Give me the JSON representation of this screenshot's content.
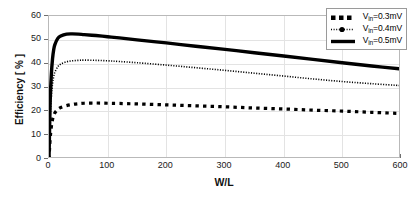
{
  "chart_data": {
    "type": "line",
    "title": "",
    "xlabel": "W/L",
    "ylabel": "Efficiency [ % ]",
    "xlim": [
      0,
      600
    ],
    "ylim": [
      0,
      60
    ],
    "xticks": [
      0,
      100,
      200,
      300,
      400,
      500,
      600
    ],
    "yticks": [
      0,
      10,
      20,
      30,
      40,
      50,
      60
    ],
    "grid": true,
    "legend_position": "upper-right",
    "series": [
      {
        "name": "V_in=0.3mV",
        "label_main": "V",
        "label_sub": "in",
        "label_tail": "=0.3mV",
        "style": "dashed",
        "color": "#000000",
        "linewidth": 3.2,
        "x": [
          0,
          2,
          4,
          6,
          8,
          10,
          15,
          20,
          30,
          40,
          50,
          60,
          80,
          100,
          120,
          150,
          200,
          250,
          300,
          350,
          400,
          450,
          500,
          550,
          600
        ],
        "y": [
          0,
          8.5,
          13.5,
          16.5,
          18.2,
          19.4,
          20.8,
          21.6,
          22.4,
          22.9,
          23.2,
          23.4,
          23.5,
          23.4,
          23.3,
          23.1,
          22.7,
          22.3,
          21.9,
          21.4,
          21.0,
          20.5,
          20.1,
          19.6,
          19.1
        ]
      },
      {
        "name": "V_in=0.4mV",
        "label_main": "V",
        "label_sub": "in",
        "label_tail": "=0.4mV",
        "style": "dotted",
        "color": "#000000",
        "linewidth": 1.6,
        "x": [
          0,
          2,
          4,
          6,
          8,
          10,
          15,
          20,
          30,
          40,
          50,
          60,
          80,
          100,
          120,
          150,
          200,
          250,
          300,
          350,
          400,
          450,
          500,
          550,
          600
        ],
        "y": [
          0,
          17.0,
          26.0,
          31.5,
          34.6,
          36.4,
          38.7,
          39.8,
          40.8,
          41.2,
          41.4,
          41.5,
          41.4,
          41.2,
          40.9,
          40.4,
          39.4,
          38.3,
          37.2,
          36.0,
          34.8,
          33.6,
          32.5,
          31.6,
          30.8
        ]
      },
      {
        "name": "V_in=0.5mV",
        "label_main": "V",
        "label_sub": "in",
        "label_tail": "=0.5mV",
        "style": "solid",
        "color": "#000000",
        "linewidth": 3.4,
        "x": [
          0,
          2,
          4,
          6,
          8,
          10,
          15,
          20,
          30,
          40,
          50,
          60,
          80,
          100,
          120,
          150,
          200,
          250,
          300,
          350,
          400,
          450,
          500,
          550,
          600
        ],
        "y": [
          0,
          24.0,
          35.5,
          42.0,
          45.8,
          48.0,
          50.6,
          51.6,
          52.4,
          52.5,
          52.4,
          52.2,
          51.8,
          51.3,
          50.8,
          50.0,
          48.7,
          47.3,
          46.0,
          44.6,
          43.2,
          41.8,
          40.4,
          39.0,
          37.8
        ]
      }
    ]
  },
  "axis": {
    "ylabel_text": "Efficiency [ % ]",
    "xlabel_text": "W/L",
    "ytick_labels": [
      "60",
      "50",
      "40",
      "30",
      "20",
      "10",
      "0"
    ],
    "xtick_labels": [
      "0",
      "100",
      "200",
      "300",
      "400",
      "500",
      "600"
    ]
  },
  "legend": {
    "entries": [
      {
        "text": "V",
        "sub": "in",
        "tail": "=0.3mV",
        "sample": "dashed-thick"
      },
      {
        "text": "V",
        "sub": "in",
        "tail": "=0.4mV",
        "sample": "dotted-marker"
      },
      {
        "text": "V",
        "sub": "in",
        "tail": "=0.5mV",
        "sample": "solid-thick"
      }
    ]
  },
  "colors": {
    "line": "#000000",
    "grid": "#e3e3e3",
    "frame": "#b9b9b9",
    "text": "#111111",
    "background": "#ffffff"
  }
}
